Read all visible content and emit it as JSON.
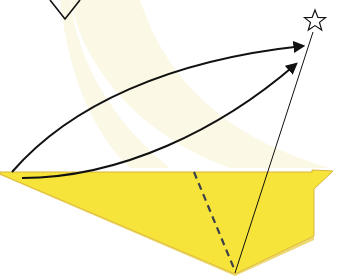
{
  "diagram": {
    "type": "origami-fold-step",
    "colors": {
      "background": "#ffffff",
      "motion_band": "#fbf8e6",
      "paper_front": "#f7e43a",
      "paper_edge": "#d9b43a",
      "paper_shadow": "#efd52e",
      "ink": "#111111",
      "valley_fold": "#3a3f4a"
    },
    "elements": {
      "top_point_marker": {
        "shape": "v-outline",
        "points": [
          [
            50,
            0
          ],
          [
            65,
            19
          ],
          [
            80,
            0
          ]
        ]
      },
      "target_star": {
        "shape": "star-outline",
        "center": [
          315,
          21
        ],
        "r_outer": 11,
        "r_inner": 5
      },
      "arrow_upper": {
        "from": [
          12,
          172
        ],
        "to": [
          305,
          45
        ],
        "style": "curved-arrow"
      },
      "arrow_lower": {
        "from": [
          22,
          179
        ],
        "to": [
          298,
          63
        ],
        "style": "curved-arrow"
      },
      "guide_line": {
        "from": [
          235,
          273
        ],
        "to": [
          313,
          32
        ],
        "style": "thin-line"
      },
      "valley_fold_line": {
        "from": [
          194,
          172
        ],
        "to": [
          235,
          271
        ],
        "style": "dashed"
      },
      "paper_polygon": [
        [
          0,
          172
        ],
        [
          312,
          172
        ],
        [
          312,
          170
        ],
        [
          333,
          171
        ],
        [
          314,
          189
        ],
        [
          314,
          236
        ],
        [
          235,
          274
        ],
        [
          0,
          174
        ]
      ]
    }
  }
}
